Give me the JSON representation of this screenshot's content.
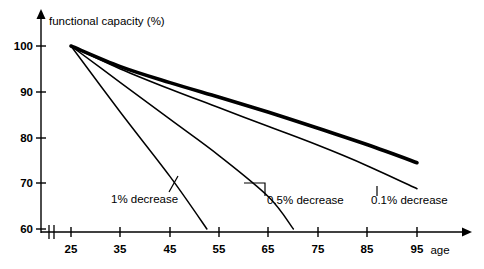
{
  "chart_data": {
    "type": "line",
    "title": "",
    "xlabel": "age",
    "ylabel": "functional capacity (%)",
    "xlim": [
      25,
      97
    ],
    "ylim": [
      60,
      103
    ],
    "x_ticks": [
      25,
      35,
      45,
      55,
      65,
      75,
      85,
      95
    ],
    "y_ticks": [
      60,
      70,
      80,
      90,
      100
    ],
    "grid": false,
    "axis_break": true,
    "legend": "inline annotations",
    "series": [
      {
        "name": "0.1% decrease",
        "style": "thick",
        "x": [
          25,
          35,
          45,
          55,
          65,
          75,
          85,
          95
        ],
        "values": [
          100,
          95.5,
          92.0,
          88.8,
          85.5,
          82.0,
          78.4,
          74.5
        ]
      },
      {
        "name": "0.1% decrease (lower band)",
        "style": "thin",
        "x": [
          25,
          35,
          45,
          55,
          65,
          75,
          85,
          95
        ],
        "values": [
          100,
          95.0,
          90.6,
          86.5,
          82.4,
          78.3,
          73.8,
          68.8
        ]
      },
      {
        "name": "0.5% decrease",
        "style": "thin",
        "x": [
          25,
          35,
          45,
          55,
          65,
          70
        ],
        "values": [
          100,
          92.0,
          84.0,
          76.0,
          67.0,
          60.0
        ]
      },
      {
        "name": "1% decrease",
        "style": "thin",
        "x": [
          25,
          35,
          45,
          52.5
        ],
        "values": [
          100,
          85.5,
          71.5,
          60.0
        ]
      }
    ],
    "annotations": [
      {
        "label": "1% decrease",
        "x": 45,
        "y": 66.5
      },
      {
        "label": "0.5% decrease",
        "x": 62,
        "y": 65.5
      },
      {
        "label": "0.1% decrease",
        "x": 83,
        "y": 65.5
      }
    ]
  },
  "axes": {
    "y_title": "functional capacity (%)",
    "x_title": "age",
    "y_tick_labels": [
      "100",
      "90",
      "80",
      "70",
      "60"
    ],
    "x_tick_labels": [
      "25",
      "35",
      "45",
      "55",
      "65",
      "75",
      "85",
      "95"
    ]
  },
  "annotations": {
    "one_percent": "1% decrease",
    "half_percent": "0.5% decrease",
    "tenth_percent": "0.1% decrease"
  },
  "colors": {
    "ink": "#000000",
    "background": "#ffffff"
  }
}
